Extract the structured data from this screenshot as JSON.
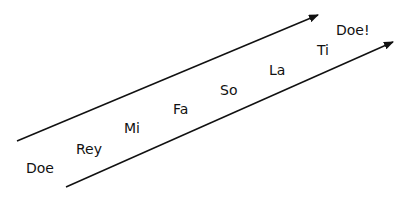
{
  "diagram": {
    "notes": [
      {
        "label": "Doe",
        "x": 26,
        "y": 161
      },
      {
        "label": "Rey",
        "x": 76,
        "y": 142
      },
      {
        "label": "Mi",
        "x": 124,
        "y": 121
      },
      {
        "label": "Fa",
        "x": 173,
        "y": 102
      },
      {
        "label": "So",
        "x": 220,
        "y": 83
      },
      {
        "label": "La",
        "x": 269,
        "y": 63
      },
      {
        "label": "Ti",
        "x": 317,
        "y": 43
      },
      {
        "label": "Doe!",
        "x": 336,
        "y": 23
      }
    ],
    "arrows": [
      {
        "name": "upper-arrow",
        "x1": 17,
        "y1": 141,
        "x2": 318,
        "y2": 15
      },
      {
        "name": "lower-arrow",
        "x1": 66,
        "y1": 187,
        "x2": 393,
        "y2": 42
      }
    ],
    "colors": {
      "line": "#111111",
      "text": "#111111"
    }
  }
}
